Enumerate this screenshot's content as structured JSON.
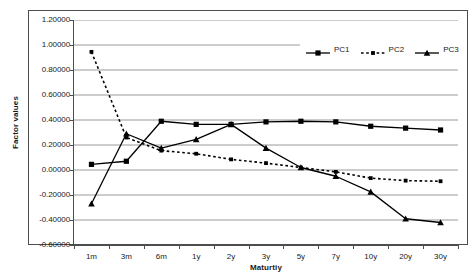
{
  "chart_data": {
    "type": "line",
    "title": "",
    "xlabel": "Maturtiy",
    "ylabel": "Factor values",
    "categories": [
      "1m",
      "3m",
      "6m",
      "1y",
      "2y",
      "3y",
      "5y",
      "7y",
      "10y",
      "20y",
      "30y"
    ],
    "ylim": [
      -0.6,
      1.2
    ],
    "ytick_labels": [
      "1.20000",
      "1.00000",
      "0.80000",
      "0.60000",
      "0.40000",
      "0.20000",
      "0.00000",
      "-0.20000",
      "-0.40000",
      "-0.60000"
    ],
    "ytick_values": [
      1.2,
      1.0,
      0.8,
      0.6,
      0.4,
      0.2,
      0.0,
      -0.2,
      -0.4,
      -0.6
    ],
    "grid": "horizontal",
    "legend_position": "top-right",
    "series": [
      {
        "name": "PC1",
        "marker": "square",
        "line_style": "solid",
        "color": "#000000",
        "values": [
          0.045,
          0.07,
          0.39,
          0.365,
          0.365,
          0.385,
          0.39,
          0.385,
          0.35,
          0.335,
          0.32
        ]
      },
      {
        "name": "PC2",
        "marker": "small-square",
        "line_style": "dotted",
        "color": "#000000",
        "values": [
          0.945,
          0.26,
          0.155,
          0.13,
          0.085,
          0.055,
          0.02,
          -0.015,
          -0.065,
          -0.085,
          -0.09
        ]
      },
      {
        "name": "PC3",
        "marker": "triangle",
        "line_style": "solid",
        "color": "#000000",
        "values": [
          -0.27,
          0.29,
          0.175,
          0.245,
          0.365,
          0.175,
          0.02,
          -0.05,
          -0.175,
          -0.39,
          -0.42
        ]
      }
    ]
  },
  "legend": {
    "items": [
      {
        "label": "PC1"
      },
      {
        "label": "PC2"
      },
      {
        "label": "PC3"
      }
    ]
  }
}
